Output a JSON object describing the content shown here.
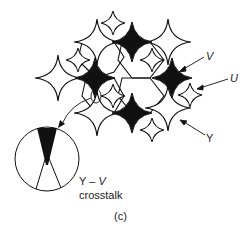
{
  "figure": {
    "panel_label": "(c)",
    "labels": {
      "V": "V",
      "U": "U",
      "Y": "Y",
      "crosstalk_line1_a": "Y",
      "crosstalk_line1_dash": "–",
      "crosstalk_line1_b": "V",
      "crosstalk_line2": "crosstalk"
    },
    "colors": {
      "stroke": "#111111",
      "fill_black": "#111111",
      "fill_white": "#ffffff"
    },
    "stars": {
      "large_white_Y": [
        [
          97,
          42
        ],
        [
          168,
          42
        ],
        [
          58,
          78
        ],
        [
          97,
          113
        ],
        [
          168,
          108
        ]
      ],
      "black_V": [
        [
          132,
          42
        ],
        [
          95,
          78
        ],
        [
          172,
          78
        ],
        [
          132,
          113
        ]
      ],
      "small_white_U": [
        [
          113,
          23
        ],
        [
          78,
          60
        ],
        [
          152,
          60
        ],
        [
          113,
          96
        ],
        [
          190,
          95
        ],
        [
          152,
          130
        ]
      ]
    }
  }
}
